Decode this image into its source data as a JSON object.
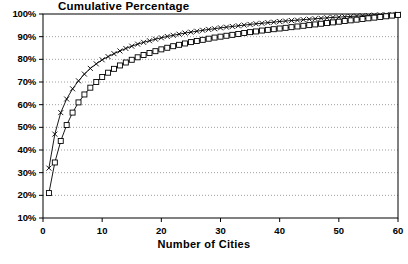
{
  "chart_data": {
    "type": "line",
    "title": "Cumulative Percentage",
    "xlabel": "Number of Cities",
    "ylabel": "",
    "xlim": [
      0,
      60
    ],
    "ylim": [
      10,
      100
    ],
    "grid": true,
    "legend_position": "none",
    "xticks": [
      0,
      10,
      20,
      30,
      40,
      50,
      60
    ],
    "xtick_labels": [
      "0",
      "10",
      "20",
      "30",
      "40",
      "50",
      "60"
    ],
    "yticks": [
      10,
      20,
      30,
      40,
      50,
      60,
      70,
      80,
      90,
      100
    ],
    "ytick_labels": [
      "10%",
      "20%",
      "30%",
      "40%",
      "50%",
      "60%",
      "70%",
      "80%",
      "90%",
      "100%"
    ],
    "x": [
      1,
      2,
      3,
      4,
      5,
      6,
      7,
      8,
      9,
      10,
      11,
      12,
      13,
      14,
      15,
      16,
      17,
      18,
      19,
      20,
      21,
      22,
      23,
      24,
      25,
      26,
      27,
      28,
      29,
      30,
      31,
      32,
      33,
      34,
      35,
      36,
      37,
      38,
      39,
      40,
      41,
      42,
      43,
      44,
      45,
      46,
      47,
      48,
      49,
      50,
      51,
      52,
      53,
      54,
      55,
      56,
      57,
      58,
      59,
      60
    ],
    "series": [
      {
        "name": "Series X",
        "marker": "cross",
        "color": "#000000",
        "values": [
          32.0,
          47.0,
          56.5,
          62.5,
          67.0,
          70.5,
          73.5,
          76.0,
          78.0,
          79.8,
          81.2,
          82.5,
          83.7,
          84.8,
          85.8,
          86.7,
          87.5,
          88.2,
          88.9,
          89.5,
          90.1,
          90.6,
          91.1,
          91.6,
          92.0,
          92.4,
          92.8,
          93.2,
          93.5,
          93.9,
          94.2,
          94.5,
          94.8,
          95.1,
          95.4,
          95.7,
          95.9,
          96.2,
          96.4,
          96.7,
          96.9,
          97.1,
          97.3,
          97.5,
          97.7,
          97.9,
          98.1,
          98.3,
          98.5,
          98.6,
          98.8,
          98.9,
          99.1,
          99.2,
          99.3,
          99.5,
          99.6,
          99.7,
          99.8,
          99.9
        ]
      },
      {
        "name": "Series Square",
        "marker": "square",
        "color": "#000000",
        "values": [
          21.0,
          34.5,
          44.0,
          51.0,
          56.5,
          61.0,
          64.5,
          67.5,
          70.0,
          72.2,
          74.1,
          75.8,
          77.3,
          78.6,
          79.8,
          80.9,
          81.9,
          82.8,
          83.6,
          84.4,
          85.1,
          85.8,
          86.4,
          87.0,
          87.6,
          88.1,
          88.6,
          89.1,
          89.6,
          90.0,
          90.4,
          90.8,
          91.2,
          91.6,
          92.0,
          92.3,
          92.7,
          93.0,
          93.3,
          93.6,
          93.9,
          94.2,
          94.5,
          94.8,
          95.1,
          95.4,
          95.7,
          96.0,
          96.3,
          96.6,
          96.9,
          97.2,
          97.5,
          97.8,
          98.1,
          98.4,
          98.7,
          99.0,
          99.3,
          99.6
        ]
      }
    ]
  }
}
